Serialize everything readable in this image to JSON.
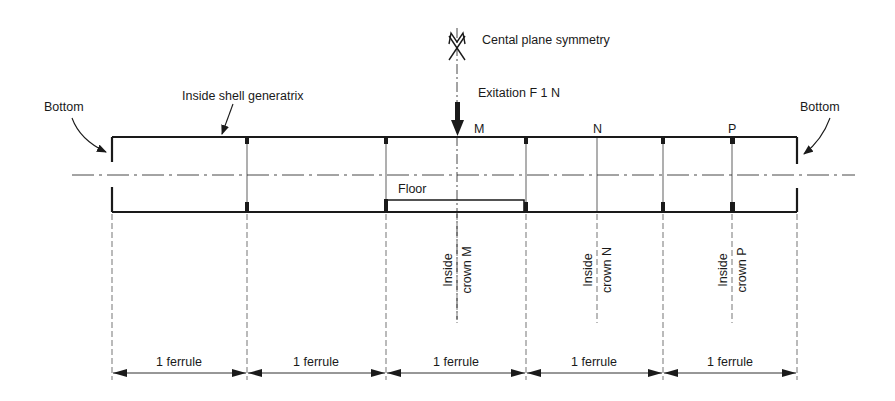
{
  "figure": {
    "type": "technical-schematic"
  },
  "labels": {
    "symmetry": "Cental plane symmetry",
    "excitation": "Exitation F  1 N",
    "bottom_left": "Bottom",
    "bottom_right": "Bottom",
    "generatrix": "Inside shell generatrix",
    "floor": "Floor",
    "point_m": "M",
    "point_n": "N",
    "point_p": "P"
  },
  "crowns": [
    {
      "line1": "Inside",
      "line2": "crown M"
    },
    {
      "line1": "Inside",
      "line2": "crown N"
    },
    {
      "line1": "Inside",
      "line2": "crown P"
    }
  ],
  "dimensions": [
    {
      "label": "1 ferrule"
    },
    {
      "label": "1 ferrule"
    },
    {
      "label": "1 ferrule"
    },
    {
      "label": "1 ferrule"
    },
    {
      "label": "1 ferrule"
    }
  ],
  "colors": {
    "ink": "#1a1a1a",
    "background": "#ffffff"
  }
}
